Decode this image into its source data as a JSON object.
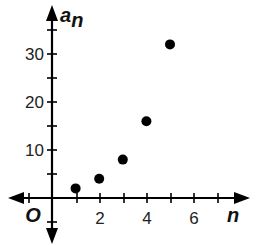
{
  "chart_data": {
    "type": "scatter",
    "title": "",
    "xlabel": "n",
    "ylabel": "a_n",
    "ylabel_main": "a",
    "ylabel_sub": "n",
    "origin_label": "O",
    "x": [
      1,
      2,
      3,
      4,
      5
    ],
    "y": [
      2,
      4,
      8,
      16,
      32
    ],
    "x_ticks": [
      2,
      4,
      6
    ],
    "x_tick_labels": [
      "2",
      "4",
      "6"
    ],
    "y_ticks": [
      10,
      20,
      30
    ],
    "y_tick_labels": [
      "10",
      "20",
      "30"
    ],
    "xlim": [
      -1.5,
      7.3
    ],
    "ylim": [
      -4,
      36
    ],
    "grid": false,
    "legend": "none",
    "colors": {
      "points": "#000000",
      "axes": "#000000"
    }
  }
}
